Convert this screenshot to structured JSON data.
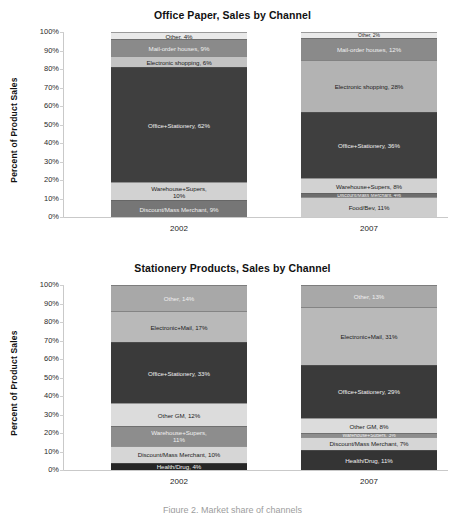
{
  "chart_data": [
    {
      "type": "bar",
      "subtype": "stacked-100-percent",
      "title": "Office Paper, Sales by Channel",
      "xlabel": "",
      "ylabel": "Percent of Product Sales",
      "ylim": [
        0,
        100
      ],
      "ytick_labels": [
        "0%",
        "10%",
        "20%",
        "30%",
        "40%",
        "50%",
        "60%",
        "70%",
        "80%",
        "90%",
        "100%"
      ],
      "grid": false,
      "legend": "none (in-segment labels)",
      "categories": [
        "2002",
        "2007"
      ],
      "series": [
        {
          "name": "Discount/Mass Merchant",
          "values": [
            9,
            4
          ]
        },
        {
          "name": "Food/Bev",
          "values": [
            0,
            11
          ]
        },
        {
          "name": "Warehouse+Supers",
          "values": [
            10,
            8
          ]
        },
        {
          "name": "Office+Stationery",
          "values": [
            62,
            36
          ]
        },
        {
          "name": "Electronic shopping",
          "values": [
            6,
            28
          ]
        },
        {
          "name": "Mail-order houses",
          "values": [
            9,
            12
          ]
        },
        {
          "name": "Other",
          "values": [
            4,
            2
          ]
        }
      ],
      "bars": [
        {
          "category": "2002",
          "segments": [
            {
              "label": "Discount/Mass Merchant, 9%",
              "value": 9,
              "color": "#767676",
              "text": "light"
            },
            {
              "label": "Warehouse+Supers,\n10%",
              "value": 10,
              "color": "#d2d2d2",
              "text": "dark"
            },
            {
              "label": "Office+Stationery, 62%",
              "value": 62,
              "color": "#3f3f3f",
              "text": "light"
            },
            {
              "label": "Electronic shopping, 6%",
              "value": 6,
              "color": "#c3c3c3",
              "text": "dark"
            },
            {
              "label": "Mail-order houses, 9%",
              "value": 9,
              "color": "#8a8a8a",
              "text": "light"
            },
            {
              "label": "Other, 4%",
              "value": 4,
              "color": "#e9e9e9",
              "text": "dark"
            }
          ]
        },
        {
          "category": "2007",
          "segments": [
            {
              "label": "Food/Bev, 11%",
              "value": 11,
              "color": "#cdcdcd",
              "text": "dark"
            },
            {
              "label": "Discount/Mass Merchant, 4%",
              "value": 2,
              "color": "#6d6d6d",
              "text": "light"
            },
            {
              "label": "Warehouse+Supers, 8%",
              "value": 8,
              "color": "#d2d2d2",
              "text": "dark"
            },
            {
              "label": "Office+Stationery, 36%",
              "value": 36,
              "color": "#3f3f3f",
              "text": "light"
            },
            {
              "label": "Electronic shopping, 28%",
              "value": 28,
              "color": "#b3b3b3",
              "text": "dark"
            },
            {
              "label": "Mail-order houses, 12%",
              "value": 12,
              "color": "#8a8a8a",
              "text": "light"
            },
            {
              "label": "Other, 2%",
              "value": 3,
              "color": "#eaeaea",
              "text": "dark"
            }
          ]
        }
      ]
    },
    {
      "type": "bar",
      "subtype": "stacked-100-percent",
      "title": "Stationery Products, Sales by Channel",
      "xlabel": "",
      "ylabel": "Percent of Product Sales",
      "ylim": [
        0,
        100
      ],
      "ytick_labels": [
        "0%",
        "10%",
        "20%",
        "30%",
        "40%",
        "50%",
        "60%",
        "70%",
        "80%",
        "90%",
        "100%"
      ],
      "grid": false,
      "legend": "none (in-segment labels)",
      "categories": [
        "2002",
        "2007"
      ],
      "series": [
        {
          "name": "Health/Drug",
          "values": [
            4,
            11
          ]
        },
        {
          "name": "Discount/Mass Merchant",
          "values": [
            10,
            7
          ]
        },
        {
          "name": "Warehouse+Supers",
          "values": [
            11,
            3
          ]
        },
        {
          "name": "Other GM",
          "values": [
            12,
            8
          ]
        },
        {
          "name": "Office+Stationery",
          "values": [
            33,
            29
          ]
        },
        {
          "name": "Electronic+Mail",
          "values": [
            17,
            31
          ]
        },
        {
          "name": "Other",
          "values": [
            14,
            13
          ]
        }
      ],
      "bars": [
        {
          "category": "2002",
          "segments": [
            {
              "label": "Health/Drug, 4%",
              "value": 4,
              "color": "#262626",
              "text": "light"
            },
            {
              "label": "Discount/Mass Merchant, 10%",
              "value": 9,
              "color": "#d6d6d6",
              "text": "dark"
            },
            {
              "label": "Warehouse+Supers,\n11%",
              "value": 11,
              "color": "#8d8d8d",
              "text": "light"
            },
            {
              "label": "Other GM, 12%",
              "value": 12,
              "color": "#dcdcdc",
              "text": "dark"
            },
            {
              "label": "Office+Stationery, 33%",
              "value": 33,
              "color": "#3a3a3a",
              "text": "light"
            },
            {
              "label": "Electronic+Mail, 17%",
              "value": 17,
              "color": "#b9b9b9",
              "text": "dark"
            },
            {
              "label": "Other, 14%",
              "value": 14,
              "color": "#a8a8a8",
              "text": "light"
            }
          ]
        },
        {
          "category": "2007",
          "segments": [
            {
              "label": "Health/Drug, 11%",
              "value": 11,
              "color": "#343434",
              "text": "light"
            },
            {
              "label": "Discount/Mass Merchant, 7%",
              "value": 7,
              "color": "#d6d6d6",
              "text": "dark"
            },
            {
              "label": "Warehouse+Supers, 3%",
              "value": 2,
              "color": "#8d8d8d",
              "text": "light"
            },
            {
              "label": "Other GM, 8%",
              "value": 8,
              "color": "#dcdcdc",
              "text": "dark"
            },
            {
              "label": "Office+Stationery, 29%",
              "value": 29,
              "color": "#3a3a3a",
              "text": "light"
            },
            {
              "label": "Electronic+Mail, 31%",
              "value": 31,
              "color": "#b9b9b9",
              "text": "dark"
            },
            {
              "label": "Other, 13%",
              "value": 12,
              "color": "#a8a8a8",
              "text": "light"
            }
          ]
        }
      ]
    }
  ],
  "footer": {
    "text": "Figure 2. Market share of channels"
  }
}
